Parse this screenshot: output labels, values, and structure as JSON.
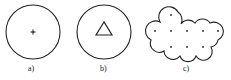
{
  "figure": {
    "panels": [
      {
        "id": "a",
        "label": "a)",
        "content": "circle with plus sign at center"
      },
      {
        "id": "b",
        "label": "b)",
        "content": "circle with triangle at center"
      },
      {
        "id": "c",
        "label": "c)",
        "content": "cloud-shaped union of circles with 9 center dots"
      }
    ]
  },
  "colors": {
    "stroke": "#222222",
    "background": "#ffffff"
  }
}
